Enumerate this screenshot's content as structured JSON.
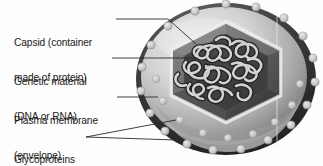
{
  "figure": {
    "background_color": "#fdfdfd",
    "width": 323,
    "height": 166
  },
  "labels": [
    {
      "id": "capsid",
      "text": "Capsid (container\nmade of protein)",
      "line1": "Capsid (container",
      "line2": "made of protein)"
    },
    {
      "id": "genetic",
      "text": "Genetic material\n(DNA or RNA)",
      "line1": "Genetic material",
      "line2": "(DNA or RNA)"
    },
    {
      "id": "plasma",
      "text": "Plasma membrane\n(envelope)",
      "line1": "Plasma membrane",
      "line2": "(envelope)"
    },
    {
      "id": "glycoproteins",
      "text": "Glycoproteins",
      "line1": "Glycoproteins",
      "line2": ""
    }
  ],
  "colors": {
    "text": "#1b1b1b",
    "leader_line": "#2a2a2a",
    "envelope_rim_dark": "#2e2e2e",
    "envelope_body_light": "#d7d7d7",
    "envelope_body_mid": "#9a9a9a",
    "capsid_face_dark": "#4d4d4d",
    "capsid_face_mid": "#6f6f6f",
    "capsid_outline_light": "#e4e4e4",
    "genetic_strand": "#cfcfcf",
    "genetic_strand_edge": "#3a3a3a",
    "glycoprotein_knob": "#c9c9c9",
    "glycoprotein_knob_edge": "#8f8f8f"
  },
  "structures": {
    "envelope": "plasma-membrane-envelope-ellipse",
    "capsid": "hexagonal-protein-capsid",
    "genetic_material": "coiled-nucleic-acid-strand",
    "glycoproteins_outer_count": 17,
    "glycoproteins_inner_count": 9
  }
}
